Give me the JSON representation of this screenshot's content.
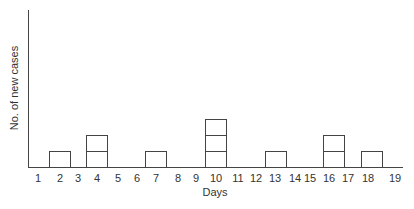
{
  "chart_data": {
    "type": "bar",
    "title": "",
    "xlabel": "Days",
    "ylabel": "No. of new cases",
    "categories": [
      "1",
      "2",
      "3",
      "4",
      "5",
      "6",
      "7",
      "8",
      "9",
      "10",
      "11",
      "12",
      "13",
      "14",
      "15",
      "16",
      "17",
      "18",
      "19"
    ],
    "values": [
      0,
      1,
      0,
      2,
      0,
      0,
      1,
      0,
      0,
      3,
      0,
      0,
      1,
      0,
      0,
      2,
      0,
      1,
      0
    ],
    "style": "epidemic curve (stacked unit boxes, one box per case)",
    "grid": false,
    "legend": null
  },
  "labels": {
    "xlabel": "Days",
    "ylabel": "No. of new cases"
  }
}
